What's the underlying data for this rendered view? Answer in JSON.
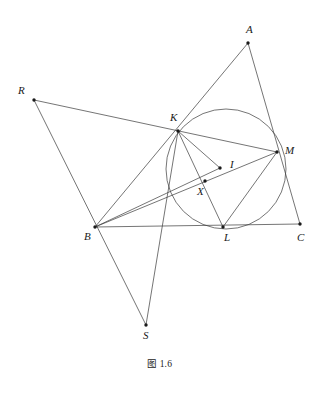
{
  "figure": {
    "caption": "图 1.6",
    "canvas": {
      "width": 319,
      "height": 393
    },
    "stroke_color": "#3a3a3a",
    "point_color": "#1a1a1a",
    "background": "#ffffff",
    "points": {
      "A": {
        "label": "A",
        "x": 248,
        "y": 43,
        "label_x": 246,
        "label_y": 24
      },
      "B": {
        "label": "B",
        "x": 95,
        "y": 227,
        "label_x": 84,
        "label_y": 231
      },
      "C": {
        "label": "C",
        "x": 300,
        "y": 224,
        "label_x": 297,
        "label_y": 232
      },
      "K": {
        "label": "K",
        "x": 178,
        "y": 131,
        "label_x": 170,
        "label_y": 112
      },
      "L": {
        "label": "L",
        "x": 223,
        "y": 227,
        "label_x": 224,
        "label_y": 232
      },
      "M": {
        "label": "M",
        "x": 277,
        "y": 152,
        "label_x": 285,
        "label_y": 145
      },
      "I": {
        "label": "I",
        "x": 220,
        "y": 168,
        "label_x": 230,
        "label_y": 159
      },
      "X": {
        "label": "X",
        "x": 205,
        "y": 181,
        "label_x": 197,
        "label_y": 186
      },
      "R": {
        "label": "R",
        "x": 34,
        "y": 100,
        "label_x": 18,
        "label_y": 85
      },
      "S": {
        "label": "S",
        "x": 146,
        "y": 325,
        "label_x": 143,
        "label_y": 330
      }
    },
    "circle": {
      "name": "incircle",
      "cx": 226,
      "cy": 169,
      "r": 60
    },
    "segments": [
      {
        "name": "segment-A-B",
        "from": "A",
        "to": "B"
      },
      {
        "name": "segment-A-C",
        "from": "A",
        "to": "C"
      },
      {
        "name": "segment-B-C",
        "from": "B",
        "to": "C"
      },
      {
        "name": "segment-R-M",
        "from": "R",
        "to": "M"
      },
      {
        "name": "segment-R-S",
        "from": "R",
        "to": "S"
      },
      {
        "name": "segment-K-S",
        "from": "K",
        "to": "S"
      },
      {
        "name": "segment-B-M",
        "from": "B",
        "to": "M"
      },
      {
        "name": "segment-K-L",
        "from": "K",
        "to": "L"
      },
      {
        "name": "segment-L-M",
        "from": "L",
        "to": "M"
      },
      {
        "name": "segment-B-I",
        "from": "B",
        "to": "I"
      },
      {
        "name": "segment-K-I",
        "from": "K",
        "to": "I"
      }
    ],
    "vertex_dot_radius": 1.7
  }
}
